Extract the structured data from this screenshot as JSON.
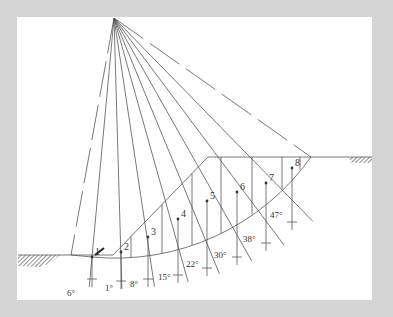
{
  "diagram": {
    "type": "slope-stability-method-of-slices",
    "center_of_rotation": {
      "x": 114,
      "y": 18
    },
    "ground": {
      "left_level_y": 255,
      "right_level_y": 157,
      "toe_x": 113,
      "crest_x": 208
    },
    "failure_arc": {
      "start": [
        92,
        257
      ],
      "end": [
        311,
        157
      ]
    },
    "slices": [
      {
        "label": "1",
        "point": [
          92,
          257
        ],
        "base": [
          92,
          257
        ],
        "angle": "6°",
        "angle_pos": [
          67,
          296
        ]
      },
      {
        "label": "2",
        "point": [
          121,
          252
        ],
        "base": [
          121,
          259
        ],
        "angle": "1°",
        "angle_pos": [
          105,
          291
        ]
      },
      {
        "label": "3",
        "point": [
          148,
          237
        ],
        "base": [
          150,
          257
        ],
        "angle": "8°",
        "angle_pos": [
          130,
          287
        ]
      },
      {
        "label": "4",
        "point": [
          178,
          219
        ],
        "base": [
          180,
          253
        ],
        "angle": "15°",
        "angle_pos": [
          158,
          280
        ]
      },
      {
        "label": "5",
        "point": [
          207,
          201
        ],
        "base": [
          208,
          246
        ],
        "angle": "22°",
        "angle_pos": [
          186,
          267
        ]
      },
      {
        "label": "6",
        "point": [
          237,
          192
        ],
        "base": [
          237,
          235
        ],
        "angle": "30°",
        "angle_pos": [
          214,
          258
        ]
      },
      {
        "label": "7",
        "point": [
          266,
          183
        ],
        "base": [
          266,
          221
        ],
        "angle": "38°",
        "angle_pos": [
          243,
          242
        ]
      },
      {
        "label": "8",
        "point": [
          292,
          168
        ],
        "base": [
          292,
          200
        ],
        "angle": "47°",
        "angle_pos": [
          270,
          218
        ]
      }
    ],
    "slice_boundaries_x": [
      131,
      162,
      192,
      221,
      252,
      282,
      300
    ]
  }
}
